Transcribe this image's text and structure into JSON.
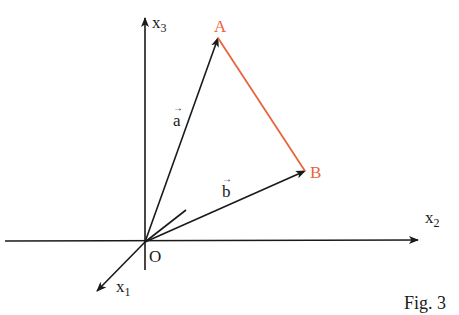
{
  "figure": {
    "caption": "Fig. 3",
    "colors": {
      "axis": "#1a1a1a",
      "triangle_edge": "#e8643c",
      "point_label": "#e8643c"
    },
    "axes": [
      {
        "name": "x3",
        "base": "x",
        "sub": "3"
      },
      {
        "name": "x2",
        "base": "x",
        "sub": "2"
      },
      {
        "name": "x1",
        "base": "x",
        "sub": "1"
      }
    ],
    "origin_label": "O",
    "points": [
      {
        "name": "A",
        "label": "A"
      },
      {
        "name": "B",
        "label": "B"
      }
    ],
    "vectors": [
      {
        "name": "a",
        "label": "a",
        "arrow": "→"
      },
      {
        "name": "b",
        "label": "b",
        "arrow": "→"
      }
    ]
  }
}
